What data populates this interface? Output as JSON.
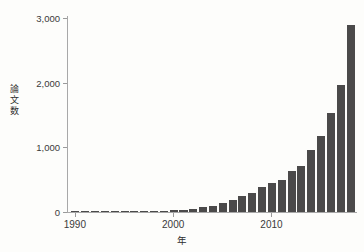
{
  "chart_data": {
    "type": "bar",
    "title": "",
    "subtitle": "",
    "xlabel": "年",
    "ylabel": "論文数",
    "ylabel_chars": "論\n文\n数",
    "xlim": [
      1989.3,
      2018.7
    ],
    "ylim": [
      0,
      3000
    ],
    "grid": false,
    "legend": null,
    "bar_color": "#4b4a4a",
    "axis_color": "#a8a8a8",
    "background": "#fdfdfb",
    "ytick_labels": [
      "0",
      "1,000",
      "2,000",
      "3,000"
    ],
    "ytick_values": [
      0,
      1000,
      2000,
      3000
    ],
    "xtick_labels": [
      "1990",
      "2000",
      "2010"
    ],
    "xtick_values": [
      1990,
      2000,
      2010
    ],
    "categories": [
      1990,
      1991,
      1992,
      1993,
      1994,
      1995,
      1996,
      1997,
      1998,
      1999,
      2000,
      2001,
      2002,
      2003,
      2004,
      2005,
      2006,
      2007,
      2008,
      2009,
      2010,
      2011,
      2012,
      2013,
      2014,
      2015,
      2016,
      2017,
      2018
    ],
    "values": [
      4,
      6,
      7,
      9,
      10,
      13,
      14,
      16,
      18,
      22,
      26,
      34,
      48,
      72,
      100,
      140,
      180,
      255,
      300,
      380,
      450,
      490,
      630,
      715,
      960,
      1180,
      1530,
      1960,
      2890
    ],
    "annotations": []
  }
}
